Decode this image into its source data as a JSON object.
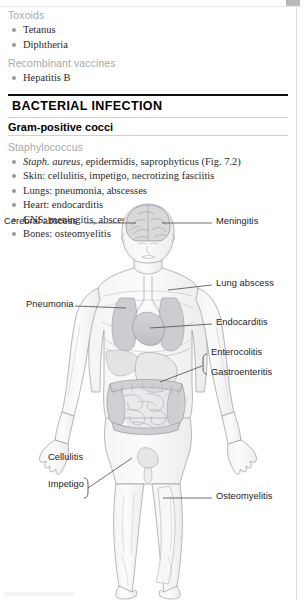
{
  "top_lists": [
    {
      "heading": "Toxoids",
      "items": [
        {
          "text": "Tetanus"
        },
        {
          "text": "Diphtheria"
        }
      ]
    },
    {
      "heading": "Recombinant vaccines",
      "items": [
        {
          "text": "Hepatitis B"
        }
      ]
    }
  ],
  "section": {
    "title": "BACTERIAL INFECTION",
    "subtitle": "Gram-positive cocci",
    "genus": "Staphylococcus",
    "items": [
      {
        "italic": "Staph. aureus",
        "rest": ", epidermidis, saprophyticus (Fig. 7.2)"
      },
      {
        "italic": "",
        "rest": "Skin: cellulitis, impetigo, necrotizing fasciitis"
      },
      {
        "italic": "",
        "rest": "Lungs: pneumonia, abscesses"
      },
      {
        "italic": "",
        "rest": "Heart: endocarditis"
      },
      {
        "italic": "",
        "rest": "CNS: meningitis, abscesses"
      },
      {
        "italic": "",
        "rest": "Bones: osteomyelitis"
      }
    ]
  },
  "figure": {
    "labels": {
      "cerebral_abscess": "Cerebral abscess",
      "meningitis": "Meningitis",
      "pneumonia": "Pneumonia",
      "lung_abscess": "Lung abscess",
      "endocarditis": "Endocarditis",
      "enterocolitis": "Enterocolitis",
      "gastroenteritis": "Gastroenteritis",
      "cellulitis": "Cellulitis",
      "impetigo": "Impetigo",
      "osteomyelitis": "Osteomyelitis"
    },
    "caption": ""
  },
  "margin": {
    "side_tab": ""
  },
  "colors": {
    "gray_heading": "#a8a8a8",
    "body_text": "#2b2b2b",
    "rule_dark": "#111111",
    "bullet": "#9a9a9a",
    "label_text": "#1c1c1c"
  }
}
